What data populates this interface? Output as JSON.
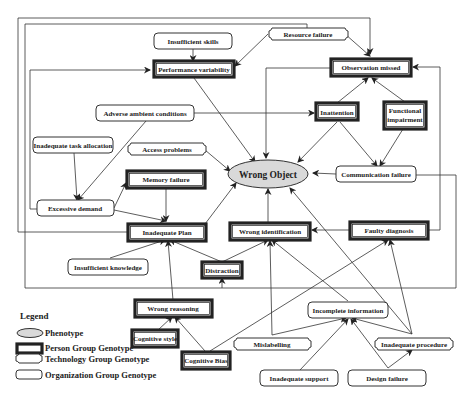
{
  "diagram": {
    "phenotype": {
      "label": "Wrong Object",
      "fill": "#d9d9d9"
    },
    "nodes": {
      "insufficient_skills": "Insufficient skills",
      "resource_failure": "Resource failure",
      "performance_variability": "Performance variability",
      "observation_missed": "Observation missed",
      "adverse_ambient_conditions": "Adverse ambient conditions",
      "inattention": "Inattention",
      "functional_impairment_1": "Functional",
      "functional_impairment_2": "impairment",
      "inadequate_task_allocation": "Inadequate task allocation",
      "access_problems": "Access problems",
      "memory_failure": "Memory failure",
      "communication_failure": "Communication failure",
      "excessive_demand": "Excessive demand",
      "inadequate_plan": "Inadequate Plan",
      "wrong_identification": "Wrong identification",
      "faulty_diagnosis": "Faulty diagnosis",
      "insufficient_knowledge": "Insufficient knowledge",
      "distraction": "Distraction",
      "wrong_reasoning": "Wrong reasoning",
      "incomplete_information": "Incomplete information",
      "cognitive_style": "Cognitive style",
      "mislabelling": "Mislabelling",
      "inadequate_procedure": "Inadequate procedure",
      "cognitive_bias": "Cognitive Bias",
      "inadequate_support": "Inadequate support",
      "design_failure": "Design failure"
    }
  },
  "legend": {
    "title": "Legend",
    "items": [
      {
        "shape": "ellipse",
        "label": "Phenotype"
      },
      {
        "shape": "thick-rect",
        "label": "Person Group Genotype"
      },
      {
        "shape": "notched-rect",
        "label": "Technology Group Genotype"
      },
      {
        "shape": "rounded-rect",
        "label": "Organization Group Genotype"
      }
    ]
  }
}
